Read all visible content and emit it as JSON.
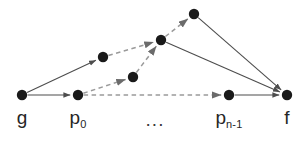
{
  "figure": {
    "title": "",
    "background_color": "#ffffff",
    "node_color": "#1a1a1a",
    "edge_solid_color": "#4d4d4d",
    "edge_dashed_color": "#9a9a9a",
    "label_color": "#262626",
    "node_radius": 5.2
  },
  "nodes": [
    {
      "id": "g",
      "label": "g",
      "sub": "",
      "x": 22,
      "y": 95,
      "has_label": true
    },
    {
      "id": "p0",
      "label": "p",
      "sub": "0",
      "x": 78,
      "y": 95,
      "has_label": true
    },
    {
      "id": "a",
      "label": "",
      "sub": "",
      "x": 103,
      "y": 57,
      "has_label": false
    },
    {
      "id": "b",
      "label": "",
      "sub": "",
      "x": 133,
      "y": 77,
      "has_label": false
    },
    {
      "id": "c",
      "label": "",
      "sub": "",
      "x": 161,
      "y": 40,
      "has_label": false
    },
    {
      "id": "d",
      "label": "",
      "sub": "",
      "x": 194,
      "y": 14,
      "has_label": false
    },
    {
      "id": "pn1",
      "label": "p",
      "sub": "n-1",
      "x": 229,
      "y": 95,
      "has_label": true
    },
    {
      "id": "f",
      "label": "f",
      "sub": "",
      "x": 287,
      "y": 95,
      "has_label": true
    }
  ],
  "ellipsis": {
    "text": "...",
    "x": 155,
    "y": 110
  },
  "edges": [
    {
      "from": "g",
      "to": "p0",
      "style": "solid",
      "arrow": true
    },
    {
      "from": "g",
      "to": "a",
      "style": "solid",
      "arrow": true
    },
    {
      "from": "p0",
      "to": "b",
      "style": "dashed",
      "arrow": true
    },
    {
      "from": "p0",
      "to": "pn1",
      "style": "dashed",
      "arrow": true
    },
    {
      "from": "a",
      "to": "c",
      "style": "dashed",
      "arrow": true
    },
    {
      "from": "b",
      "to": "c",
      "style": "dashed",
      "arrow": true
    },
    {
      "from": "c",
      "to": "d",
      "style": "dashed",
      "arrow": true
    },
    {
      "from": "c",
      "to": "f",
      "style": "solid",
      "arrow": true
    },
    {
      "from": "d",
      "to": "f",
      "style": "solid",
      "arrow": true
    },
    {
      "from": "pn1",
      "to": "f",
      "style": "solid",
      "arrow": true
    }
  ],
  "labels": {
    "g": "g",
    "p0_base": "p",
    "p0_sub": "0",
    "pn1_base": "p",
    "pn1_sub": "n-1",
    "f": "f",
    "ellipsis": "..."
  }
}
